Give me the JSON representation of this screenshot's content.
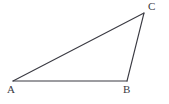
{
  "figure": {
    "kind": "geometry-diagram",
    "shape": "triangle",
    "width": 169,
    "height": 104,
    "background_color": "#ffffff",
    "stroke_color": "#3a3a42",
    "stroke_width": 1.1,
    "label_color": "#3a3a42",
    "label_font_size": 11,
    "vertices": [
      {
        "id": "A",
        "label": "A",
        "x": 13,
        "y": 81,
        "label_x": 7,
        "label_y": 84
      },
      {
        "id": "B",
        "label": "B",
        "x": 127,
        "y": 81,
        "label_x": 123,
        "label_y": 84
      },
      {
        "id": "C",
        "label": "C",
        "x": 144,
        "y": 13,
        "label_x": 148,
        "label_y": 1
      }
    ],
    "edges": [
      {
        "id": "AB",
        "from": "A",
        "to": "B",
        "x1": 13,
        "y1": 81,
        "x2": 127,
        "y2": 81
      },
      {
        "id": "BC",
        "from": "B",
        "to": "C",
        "x1": 127,
        "y1": 81,
        "x2": 144,
        "y2": 13
      },
      {
        "id": "CA",
        "from": "C",
        "to": "A",
        "x1": 144,
        "y1": 13,
        "x2": 13,
        "y2": 81
      }
    ],
    "polygon_points": "13,81 127,81 144,13"
  }
}
